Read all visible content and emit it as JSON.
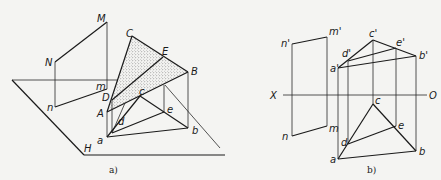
{
  "figure_a": {
    "caption": "a)",
    "plane_label": "H",
    "points": {
      "M": "M",
      "N": "N",
      "n": "n",
      "m": "m",
      "C": "C",
      "E": "E",
      "B": "B",
      "D": "D",
      "A": "A",
      "c": "c",
      "e": "e",
      "d": "d",
      "a": "a",
      "b": "b"
    }
  },
  "figure_b": {
    "caption": "b)",
    "axis_left": "X",
    "axis_right": "O",
    "points": {
      "n_p": "n'",
      "m_p": "m'",
      "n": "n",
      "m": "m",
      "c_p": "c'",
      "e_p": "e'",
      "b_p": "b'",
      "d_p": "d'",
      "a_p": "a'",
      "c": "c",
      "e": "e",
      "d": "d",
      "a": "a",
      "b": "b"
    }
  },
  "colors": {
    "line": "#1a1a1a",
    "background": "#f4f4f2",
    "stipple": "#555555"
  }
}
